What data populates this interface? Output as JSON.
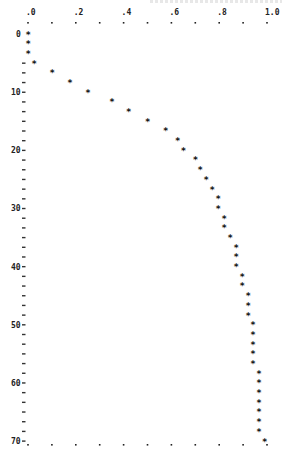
{
  "chart_data": {
    "type": "scatter",
    "title": "",
    "xlabel": "",
    "ylabel": "",
    "orientation": "x-axis on top, y increases downward",
    "xlim": [
      0.0,
      1.0
    ],
    "ylim": [
      0,
      70
    ],
    "x_ticks": [
      ".0",
      ".2",
      ".4",
      ".6",
      ".8",
      "1.0"
    ],
    "x_tick_values": [
      0.0,
      0.2,
      0.4,
      0.6,
      0.8,
      1.0
    ],
    "y_ticks": [
      "0",
      "10",
      "20",
      "30",
      "40",
      "50",
      "60",
      "70"
    ],
    "y_tick_values": [
      0,
      10,
      20,
      30,
      40,
      50,
      60,
      70
    ],
    "grid": false,
    "marker": "*",
    "series": [
      {
        "name": "profile",
        "y": [
          0,
          1.67,
          3.33,
          5,
          6.67,
          8.33,
          10,
          11.67,
          13.33,
          15,
          16.67,
          18.33,
          20,
          21.67,
          23.33,
          25,
          26.67,
          28.33,
          30,
          31.67,
          33.33,
          35,
          36.67,
          38.33,
          40,
          41.67,
          43.33,
          45,
          46.67,
          48.33,
          50,
          51.67,
          53.33,
          55,
          56.67,
          58.33,
          60,
          61.67,
          63.33,
          65,
          66.67,
          68.33,
          70
        ],
        "x": [
          0.0,
          0.0,
          0.0,
          0.025,
          0.1,
          0.175,
          0.25,
          0.35,
          0.42,
          0.5,
          0.575,
          0.625,
          0.65,
          0.7,
          0.72,
          0.745,
          0.77,
          0.795,
          0.795,
          0.82,
          0.82,
          0.845,
          0.87,
          0.87,
          0.87,
          0.895,
          0.895,
          0.92,
          0.92,
          0.92,
          0.94,
          0.94,
          0.94,
          0.94,
          0.94,
          0.965,
          0.965,
          0.965,
          0.965,
          0.965,
          0.965,
          0.965,
          0.99
        ]
      }
    ]
  },
  "axes": {
    "top_labels": [
      ".0",
      ".2",
      ".4",
      ".6",
      ".8",
      "1.0"
    ],
    "left_labels": [
      "0",
      "10",
      "20",
      "30",
      "40",
      "50",
      "60",
      "70"
    ]
  }
}
